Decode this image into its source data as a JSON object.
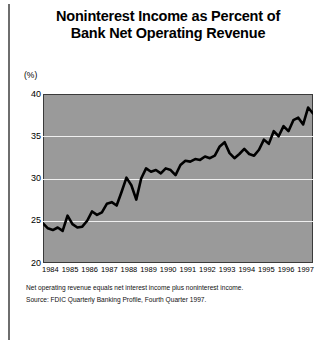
{
  "title": {
    "line1": "Noninterest Income as Percent of",
    "line2": "Bank Net Operating Revenue"
  },
  "axis": {
    "unit_label": "(%)",
    "y_ticks": [
      "40",
      "35",
      "30",
      "25",
      "20"
    ],
    "x_ticks": [
      "1984",
      "1985",
      "1986",
      "1987",
      "1988",
      "1989",
      "1990",
      "1991",
      "1992",
      "1993",
      "1994",
      "1995",
      "1996",
      "1997"
    ]
  },
  "notes": {
    "definition": "Net operating revenue equals net interest income plus noninterest income.",
    "source": "Source: FDIC Quarterly Banking Profile, Fourth Quarter 1997."
  },
  "colors": {
    "plot_background": "#9a9a9a",
    "gridline": "#efefef",
    "series_line": "#000000",
    "page_background": "#ffffff",
    "rule": "#6e6e6e"
  },
  "chart_data": {
    "type": "line",
    "title": "Noninterest Income as Percent of Bank Net Operating Revenue",
    "xlabel": "",
    "ylabel": "(%)",
    "ylim": [
      20,
      40
    ],
    "xlim": [
      1984,
      1997.75
    ],
    "grid": true,
    "gridlines_at": [
      25,
      30,
      35
    ],
    "legend": "none",
    "y_ticks": [
      20,
      25,
      30,
      35,
      40
    ],
    "x_ticks": [
      1984,
      1985,
      1986,
      1987,
      1988,
      1989,
      1990,
      1991,
      1992,
      1993,
      1994,
      1995,
      1996,
      1997
    ],
    "series": [
      {
        "name": "Noninterest income as percent of net operating revenue",
        "x": [
          1984.0,
          1984.25,
          1984.5,
          1984.75,
          1985.0,
          1985.25,
          1985.5,
          1985.75,
          1986.0,
          1986.25,
          1986.5,
          1986.75,
          1987.0,
          1987.25,
          1987.5,
          1987.75,
          1988.0,
          1988.25,
          1988.5,
          1988.75,
          1989.0,
          1989.25,
          1989.5,
          1989.75,
          1990.0,
          1990.25,
          1990.5,
          1990.75,
          1991.0,
          1991.25,
          1991.5,
          1991.75,
          1992.0,
          1992.25,
          1992.5,
          1992.75,
          1993.0,
          1993.25,
          1993.5,
          1993.75,
          1994.0,
          1994.25,
          1994.5,
          1994.75,
          1995.0,
          1995.25,
          1995.5,
          1995.75,
          1996.0,
          1996.25,
          1996.5,
          1996.75,
          1997.0,
          1997.25,
          1997.5,
          1997.75
        ],
        "values": [
          24.7,
          24.1,
          23.9,
          24.2,
          23.8,
          25.6,
          24.6,
          24.2,
          24.3,
          25.0,
          26.1,
          25.7,
          26.0,
          27.0,
          27.2,
          26.8,
          28.4,
          30.1,
          29.2,
          27.5,
          30.0,
          31.2,
          30.8,
          31.0,
          30.6,
          31.2,
          31.0,
          30.4,
          31.6,
          32.1,
          32.0,
          32.3,
          32.2,
          32.6,
          32.4,
          32.7,
          33.8,
          34.3,
          33.0,
          32.4,
          32.9,
          33.5,
          32.9,
          32.7,
          33.4,
          34.6,
          34.1,
          35.6,
          35.0,
          36.2,
          35.6,
          36.9,
          37.2,
          36.4,
          38.4,
          37.7
        ]
      }
    ]
  }
}
